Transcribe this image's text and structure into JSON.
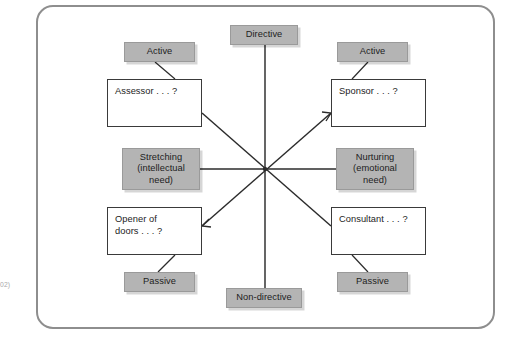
{
  "diagram": {
    "frame": {
      "border_color": "#8e8e8e",
      "background": "#ffffff"
    },
    "colors": {
      "chip_fill": "#b4b4b4",
      "chip_border": "#9a9a9a",
      "box_fill": "#ffffff",
      "box_border": "#3a3a3a",
      "line": "#2b2b2b",
      "text": "#1d1d1d"
    },
    "axes": {
      "vertical": {
        "top_label": "Directive",
        "bottom_label": "Non-directive"
      },
      "horizontal": {
        "left_label": "Stretching (intellectual need)",
        "left_label_lines": [
          "Stretching",
          "(intellectual",
          "need)"
        ],
        "right_label": "Nurturing (emotional need)",
        "right_label_lines": [
          "Nurturing",
          "(emotional",
          "need)"
        ]
      }
    },
    "quadrants": [
      {
        "id": "top-left",
        "role": "Assessor . . . ?",
        "role_lines": [
          "Assessor . . . ?"
        ],
        "tag": "Active"
      },
      {
        "id": "top-right",
        "role": "Sponsor . . . ?",
        "role_lines": [
          "Sponsor . . . ?"
        ],
        "tag": "Active"
      },
      {
        "id": "bottom-left",
        "role": "Opener of doors . . . ?",
        "role_lines": [
          "Opener of",
          "doors . . . ?"
        ],
        "tag": "Passive"
      },
      {
        "id": "bottom-right",
        "role": "Consultant . . . ?",
        "role_lines": [
          "Consultant . . . ?"
        ],
        "tag": "Passive"
      }
    ],
    "margin_note": {
      "line1": "",
      "line2": "",
      "source": "02)"
    }
  }
}
